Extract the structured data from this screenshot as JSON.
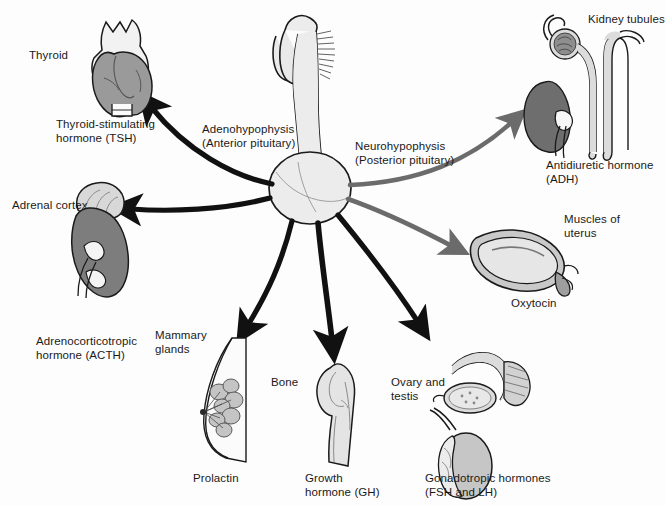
{
  "figure": {
    "background_color": "#fdfdfd",
    "text_color": "#1a1a1a"
  },
  "gland": {
    "name": "pituitary-gland",
    "fill": "#e8e8e8",
    "stroke": "#1a1a1a",
    "anterior": {
      "label_line1": "Adenohypophysis",
      "label_line2": "(Anterior pituitary)",
      "arrow_color": "#111111"
    },
    "posterior": {
      "label_line1": "Neurohypophysis",
      "label_line2": "(Posterior pituitary)",
      "arrow_color": "#6b6b6b"
    }
  },
  "targets": [
    {
      "id": "thyroid",
      "organ_label": "Thyroid",
      "hormone_line1": "Thyroid-stimulating",
      "hormone_line2": "hormone (TSH)",
      "source": "anterior",
      "organ_fill": "#9a9a9a",
      "accent_fill": "#f2f2f2"
    },
    {
      "id": "adrenal-cortex",
      "organ_label": "Adrenal cortex",
      "hormone_line1": "Adrenocorticotropic",
      "hormone_line2": "hormone (ACTH)",
      "source": "anterior",
      "organ_fill": "#7d7d7d",
      "accent_fill": "#d8d8d8"
    },
    {
      "id": "mammary-glands",
      "organ_label_line1": "Mammary",
      "organ_label_line2": "glands",
      "hormone_line1": "Prolactin",
      "source": "anterior",
      "organ_fill": "#fbfbfb",
      "accent_fill": "#c4c4c4"
    },
    {
      "id": "bone",
      "organ_label": "Bone",
      "hormone_line1": "Growth",
      "hormone_line2": "hormone (GH)",
      "source": "anterior",
      "organ_fill": "#e4e4e4",
      "accent_fill": "#cfcfcf"
    },
    {
      "id": "ovary-and-testis",
      "organ_label_line1": "Ovary and",
      "organ_label_line2": "testis",
      "hormone_line1": "Gonadotropic hormones",
      "hormone_line2": "(FSH and LH)",
      "source": "anterior",
      "organ_fill": "#d2d2d2",
      "accent_fill": "#b0b0b0"
    },
    {
      "id": "kidney-tubules",
      "organ_label": "Kidney tubules",
      "hormone_line1": "Antidiuretic hormone",
      "hormone_line2": "(ADH)",
      "source": "posterior",
      "organ_fill": "#6e6e6e",
      "accent_fill": "#dcdcdc"
    },
    {
      "id": "uterus-muscles",
      "organ_label_line1": "Muscles of",
      "organ_label_line2": "uterus",
      "hormone_line1": "Oxytocin",
      "source": "posterior",
      "organ_fill": "#c9c9c9",
      "accent_fill": "#9e9e9e"
    }
  ]
}
